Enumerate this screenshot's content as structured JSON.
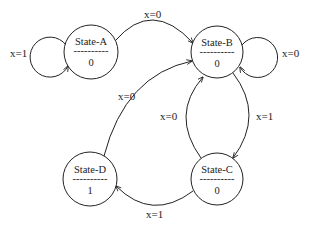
{
  "diagram": {
    "type": "state-machine",
    "states": [
      {
        "id": "A",
        "name": "State-A",
        "divider": "----------",
        "output": "0"
      },
      {
        "id": "B",
        "name": "State-B",
        "divider": "----------",
        "output": "0"
      },
      {
        "id": "C",
        "name": "State-C",
        "divider": "----------",
        "output": "0"
      },
      {
        "id": "D",
        "name": "State-D",
        "divider": "----------",
        "output": "1"
      }
    ],
    "transitions": [
      {
        "from": "A",
        "to": "A",
        "label": "x=1"
      },
      {
        "from": "A",
        "to": "B",
        "label": "x=0"
      },
      {
        "from": "B",
        "to": "B",
        "label": "x=0"
      },
      {
        "from": "B",
        "to": "C",
        "label": "x=1"
      },
      {
        "from": "C",
        "to": "B",
        "label": "x=0"
      },
      {
        "from": "C",
        "to": "D",
        "label": "x=1"
      },
      {
        "from": "D",
        "to": "B",
        "label": "x=0"
      }
    ]
  }
}
